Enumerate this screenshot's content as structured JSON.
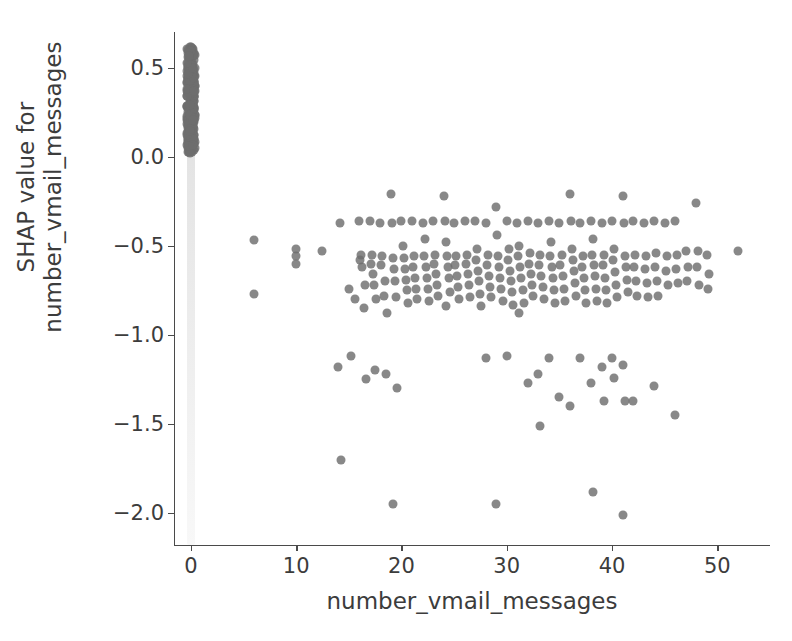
{
  "figure": {
    "width": 792,
    "height": 641,
    "background": "#ffffff",
    "point_color": "#6e6e6e",
    "axis_color": "#4a4a4a",
    "text_color": "#3c3c3c"
  },
  "chart_data": {
    "type": "scatter",
    "title": "",
    "xlabel": "number_vmail_messages",
    "ylabel": "SHAP value for\nnumber_vmail_messages",
    "ylabel_line1": "SHAP value for",
    "ylabel_line2": "number_vmail_messages",
    "xlim": [
      -1.6,
      55.0
    ],
    "ylim": [
      -2.18,
      0.7
    ],
    "xticks": [
      0,
      10,
      20,
      30,
      40,
      50
    ],
    "xticklabels": [
      "0",
      "10",
      "20",
      "30",
      "40",
      "50"
    ],
    "yticks": [
      0.5,
      0.0,
      -0.5,
      -1.0,
      -1.5,
      -2.0
    ],
    "yticklabels": [
      "0.5",
      "0.0",
      "−0.5",
      "−1.0",
      "−1.5",
      "−2.0"
    ],
    "grid": false,
    "legend": null,
    "marker_size": 9,
    "marker_alpha": 0.82,
    "series": [
      {
        "name": "zero-vmail cluster",
        "note": "dense overplotted column of points at x=0 spanning SHAP 0.02 to 0.62",
        "x_value": 0,
        "y_range": [
          0.02,
          0.62
        ],
        "approx_count": 2400
      },
      {
        "name": "nonzero-vmail points",
        "points": [
          [
            6.0,
            -0.47
          ],
          [
            6.0,
            -0.77
          ],
          [
            10.0,
            -0.52
          ],
          [
            10.0,
            -0.56
          ],
          [
            10.0,
            -0.6
          ],
          [
            12.5,
            -0.53
          ],
          [
            14.2,
            -0.37
          ],
          [
            14.0,
            -1.18
          ],
          [
            14.3,
            -1.7
          ],
          [
            15.0,
            -0.74
          ],
          [
            15.2,
            -1.12
          ],
          [
            15.6,
            -0.8
          ],
          [
            16.0,
            -0.36
          ],
          [
            16.2,
            -0.55
          ],
          [
            16.1,
            -0.58
          ],
          [
            16.3,
            -0.62
          ],
          [
            16.5,
            -0.72
          ],
          [
            16.4,
            -0.85
          ],
          [
            16.6,
            -1.25
          ],
          [
            17.0,
            -0.36
          ],
          [
            17.2,
            -0.55
          ],
          [
            17.1,
            -0.6
          ],
          [
            17.3,
            -0.66
          ],
          [
            17.4,
            -0.72
          ],
          [
            17.6,
            -0.8
          ],
          [
            17.5,
            -1.2
          ],
          [
            18.0,
            -0.37
          ],
          [
            18.2,
            -0.56
          ],
          [
            18.1,
            -0.61
          ],
          [
            18.4,
            -0.7
          ],
          [
            18.3,
            -0.78
          ],
          [
            18.6,
            -0.88
          ],
          [
            18.5,
            -1.22
          ],
          [
            19.0,
            -0.21
          ],
          [
            19.1,
            -0.37
          ],
          [
            19.2,
            -0.57
          ],
          [
            19.3,
            -0.63
          ],
          [
            19.4,
            -0.7
          ],
          [
            19.5,
            -0.79
          ],
          [
            19.6,
            -1.3
          ],
          [
            19.2,
            -1.95
          ],
          [
            20.0,
            -0.36
          ],
          [
            20.1,
            -0.5
          ],
          [
            20.2,
            -0.57
          ],
          [
            20.3,
            -0.63
          ],
          [
            20.4,
            -0.69
          ],
          [
            20.5,
            -0.75
          ],
          [
            20.6,
            -0.82
          ],
          [
            21.0,
            -0.36
          ],
          [
            21.2,
            -0.56
          ],
          [
            21.1,
            -0.62
          ],
          [
            21.3,
            -0.68
          ],
          [
            21.4,
            -0.74
          ],
          [
            21.5,
            -0.8
          ],
          [
            22.0,
            -0.37
          ],
          [
            22.2,
            -0.46
          ],
          [
            22.1,
            -0.56
          ],
          [
            22.3,
            -0.62
          ],
          [
            22.4,
            -0.68
          ],
          [
            22.5,
            -0.74
          ],
          [
            22.6,
            -0.81
          ],
          [
            23.0,
            -0.36
          ],
          [
            23.2,
            -0.55
          ],
          [
            23.1,
            -0.6
          ],
          [
            23.3,
            -0.66
          ],
          [
            23.4,
            -0.72
          ],
          [
            23.5,
            -0.78
          ],
          [
            24.0,
            -0.22
          ],
          [
            24.1,
            -0.36
          ],
          [
            24.2,
            -0.48
          ],
          [
            24.3,
            -0.56
          ],
          [
            24.4,
            -0.62
          ],
          [
            24.5,
            -0.68
          ],
          [
            24.6,
            -0.76
          ],
          [
            24.2,
            -0.84
          ],
          [
            25.0,
            -0.37
          ],
          [
            25.2,
            -0.56
          ],
          [
            25.1,
            -0.61
          ],
          [
            25.3,
            -0.67
          ],
          [
            25.4,
            -0.73
          ],
          [
            25.5,
            -0.8
          ],
          [
            26.0,
            -0.36
          ],
          [
            26.2,
            -0.55
          ],
          [
            26.1,
            -0.6
          ],
          [
            26.3,
            -0.66
          ],
          [
            26.4,
            -0.72
          ],
          [
            26.5,
            -0.79
          ],
          [
            27.0,
            -0.36
          ],
          [
            27.2,
            -0.52
          ],
          [
            27.1,
            -0.58
          ],
          [
            27.3,
            -0.64
          ],
          [
            27.4,
            -0.7
          ],
          [
            27.5,
            -0.77
          ],
          [
            27.6,
            -0.84
          ],
          [
            28.0,
            -0.37
          ],
          [
            28.2,
            -0.55
          ],
          [
            28.1,
            -0.61
          ],
          [
            28.3,
            -0.67
          ],
          [
            28.4,
            -0.73
          ],
          [
            28.5,
            -0.79
          ],
          [
            28.0,
            -1.13
          ],
          [
            29.0,
            -0.28
          ],
          [
            29.1,
            -0.44
          ],
          [
            29.2,
            -0.56
          ],
          [
            29.3,
            -0.62
          ],
          [
            29.4,
            -0.68
          ],
          [
            29.5,
            -0.74
          ],
          [
            29.6,
            -0.81
          ],
          [
            29.0,
            -1.95
          ],
          [
            30.0,
            -0.36
          ],
          [
            30.2,
            -0.52
          ],
          [
            30.1,
            -0.58
          ],
          [
            30.3,
            -0.64
          ],
          [
            30.4,
            -0.7
          ],
          [
            30.5,
            -0.76
          ],
          [
            30.6,
            -0.83
          ],
          [
            30.0,
            -1.12
          ],
          [
            31.0,
            -0.37
          ],
          [
            31.2,
            -0.5
          ],
          [
            31.1,
            -0.56
          ],
          [
            31.3,
            -0.62
          ],
          [
            31.4,
            -0.68
          ],
          [
            31.5,
            -0.75
          ],
          [
            31.6,
            -0.82
          ],
          [
            31.2,
            -0.88
          ],
          [
            32.0,
            -0.36
          ],
          [
            32.2,
            -0.54
          ],
          [
            32.1,
            -0.6
          ],
          [
            32.3,
            -0.66
          ],
          [
            32.4,
            -0.72
          ],
          [
            32.5,
            -0.78
          ],
          [
            32.0,
            -1.27
          ],
          [
            33.0,
            -0.37
          ],
          [
            33.2,
            -0.55
          ],
          [
            33.1,
            -0.61
          ],
          [
            33.3,
            -0.67
          ],
          [
            33.4,
            -0.73
          ],
          [
            33.5,
            -0.8
          ],
          [
            33.0,
            -1.22
          ],
          [
            33.2,
            -1.51
          ],
          [
            34.0,
            -0.36
          ],
          [
            34.2,
            -0.48
          ],
          [
            34.1,
            -0.56
          ],
          [
            34.3,
            -0.62
          ],
          [
            34.4,
            -0.68
          ],
          [
            34.5,
            -0.75
          ],
          [
            34.6,
            -0.82
          ],
          [
            34.0,
            -1.13
          ],
          [
            35.0,
            -0.37
          ],
          [
            35.2,
            -0.55
          ],
          [
            35.1,
            -0.61
          ],
          [
            35.3,
            -0.67
          ],
          [
            35.4,
            -0.74
          ],
          [
            35.5,
            -0.81
          ],
          [
            35.0,
            -1.35
          ],
          [
            36.0,
            -0.21
          ],
          [
            36.1,
            -0.36
          ],
          [
            36.2,
            -0.52
          ],
          [
            36.3,
            -0.58
          ],
          [
            36.4,
            -0.64
          ],
          [
            36.5,
            -0.71
          ],
          [
            36.6,
            -0.78
          ],
          [
            36.0,
            -1.4
          ],
          [
            37.0,
            -0.37
          ],
          [
            37.2,
            -0.56
          ],
          [
            37.1,
            -0.62
          ],
          [
            37.3,
            -0.68
          ],
          [
            37.4,
            -0.75
          ],
          [
            37.5,
            -0.82
          ],
          [
            37.0,
            -1.13
          ],
          [
            38.0,
            -0.36
          ],
          [
            38.2,
            -0.46
          ],
          [
            38.1,
            -0.55
          ],
          [
            38.3,
            -0.61
          ],
          [
            38.4,
            -0.67
          ],
          [
            38.5,
            -0.74
          ],
          [
            38.6,
            -0.81
          ],
          [
            38.0,
            -1.27
          ],
          [
            38.2,
            -1.88
          ],
          [
            39.0,
            -0.37
          ],
          [
            39.2,
            -0.55
          ],
          [
            39.1,
            -0.61
          ],
          [
            39.3,
            -0.68
          ],
          [
            39.4,
            -0.75
          ],
          [
            39.5,
            -0.82
          ],
          [
            39.0,
            -1.18
          ],
          [
            39.2,
            -1.37
          ],
          [
            40.0,
            -0.36
          ],
          [
            40.2,
            -0.52
          ],
          [
            40.1,
            -0.58
          ],
          [
            40.3,
            -0.65
          ],
          [
            40.4,
            -0.72
          ],
          [
            40.5,
            -0.79
          ],
          [
            40.0,
            -1.13
          ],
          [
            40.2,
            -1.24
          ],
          [
            41.0,
            -0.22
          ],
          [
            41.1,
            -0.37
          ],
          [
            41.2,
            -0.56
          ],
          [
            41.3,
            -0.62
          ],
          [
            41.4,
            -0.69
          ],
          [
            41.5,
            -0.76
          ],
          [
            41.0,
            -1.17
          ],
          [
            41.2,
            -1.37
          ],
          [
            41.0,
            -2.01
          ],
          [
            42.0,
            -0.36
          ],
          [
            42.2,
            -0.55
          ],
          [
            42.1,
            -0.62
          ],
          [
            42.3,
            -0.7
          ],
          [
            42.4,
            -0.78
          ],
          [
            42.0,
            -1.37
          ],
          [
            43.0,
            -0.37
          ],
          [
            43.2,
            -0.56
          ],
          [
            43.1,
            -0.63
          ],
          [
            43.3,
            -0.71
          ],
          [
            43.4,
            -0.79
          ],
          [
            44.0,
            -0.36
          ],
          [
            44.2,
            -0.54
          ],
          [
            44.1,
            -0.62
          ],
          [
            44.3,
            -0.7
          ],
          [
            44.4,
            -0.78
          ],
          [
            44.0,
            -1.29
          ],
          [
            45.0,
            -0.37
          ],
          [
            45.2,
            -0.56
          ],
          [
            45.1,
            -0.64
          ],
          [
            45.3,
            -0.72
          ],
          [
            46.0,
            -0.36
          ],
          [
            46.2,
            -0.55
          ],
          [
            46.1,
            -0.63
          ],
          [
            46.3,
            -0.71
          ],
          [
            46.0,
            -1.45
          ],
          [
            47.0,
            -0.53
          ],
          [
            47.2,
            -0.62
          ],
          [
            47.1,
            -0.7
          ],
          [
            48.0,
            -0.26
          ],
          [
            48.2,
            -0.53
          ],
          [
            48.1,
            -0.62
          ],
          [
            48.3,
            -0.72
          ],
          [
            49.0,
            -0.55
          ],
          [
            49.2,
            -0.66
          ],
          [
            49.1,
            -0.74
          ],
          [
            52.0,
            -0.53
          ]
        ]
      }
    ]
  }
}
